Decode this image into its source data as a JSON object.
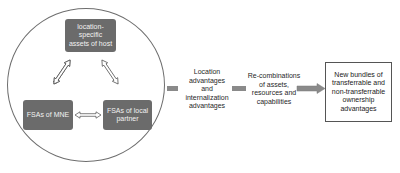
{
  "diagram": {
    "circle": {
      "nodes": {
        "host": {
          "label": "location-specific assets of host",
          "lines": [
            "location-",
            "specific",
            "assets of host"
          ]
        },
        "mne": {
          "label": "FSAs of MNE"
        },
        "partner": {
          "label": "FSAs of local partner",
          "lines": [
            "FSAs of local",
            "partner"
          ]
        }
      },
      "links": [
        {
          "from": "host",
          "to": "mne",
          "type": "double-arrow"
        },
        {
          "from": "host",
          "to": "partner",
          "type": "double-arrow"
        },
        {
          "from": "mne",
          "to": "partner",
          "type": "double-arrow"
        }
      ]
    },
    "stage_1": {
      "label": "Location advantages and internalization advantages",
      "lines": [
        "Location",
        "advantages",
        "and",
        "internalization",
        "advantages"
      ]
    },
    "stage_2": {
      "label": "Re-combinations of assets, resources and capabilities",
      "lines": [
        "Re-combinations",
        "of assets,",
        "resources and",
        "capabilities"
      ]
    },
    "outcome": {
      "label": "New bundles of transferrable and non-transferrable ownership advantages",
      "lines": [
        "New bundles of",
        "transferrable and",
        "non-transferrable",
        "ownership",
        "advantages"
      ]
    },
    "colors": {
      "node_fill": "#6b6b6b",
      "node_text": "#f2f2f2",
      "connector": "#8a8a8a",
      "circle_stroke": "#6e6e6e"
    }
  }
}
